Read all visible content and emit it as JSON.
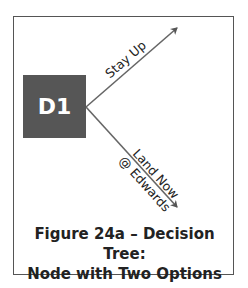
{
  "diagram": {
    "node": {
      "label": "D1",
      "color": "#565656"
    },
    "branches": [
      {
        "label": "Stay Up",
        "direction": "up-right"
      },
      {
        "label_line1": "Land Now",
        "label_line2": "@ Edwards",
        "direction": "down-right"
      }
    ],
    "caption": {
      "line1": "Figure 24a – Decision Tree:",
      "line2": "Node with Two Options"
    }
  }
}
